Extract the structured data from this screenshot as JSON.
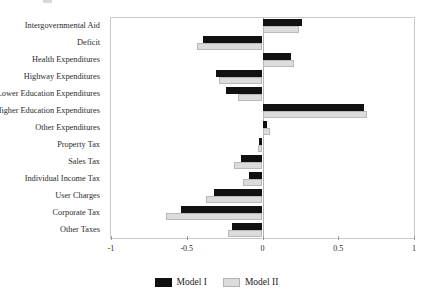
{
  "chart_data": {
    "type": "bar",
    "orientation": "horizontal",
    "title": "",
    "xlabel": "",
    "ylabel": "",
    "xlim": [
      -1,
      1
    ],
    "xticks": [
      -1,
      -0.5,
      0,
      0.5,
      1
    ],
    "xticklabels": [
      "-1",
      "-0.5",
      "0",
      "0.5",
      "1"
    ],
    "grid": false,
    "zero_reference_line": true,
    "legend_position": "bottom-center",
    "categories": [
      "Intergovernmental Aid",
      "Deficit",
      "Health Expenditures",
      "Highway Expenditures",
      "Lower Education Expenditures",
      "Higher Education Expenditures",
      "Other Expenditures",
      "Property Tax",
      "Sales Tax",
      "Individual Income Tax",
      "User Charges",
      "Corporate Tax",
      "Other Taxes"
    ],
    "series": [
      {
        "name": "Model I",
        "color": "#111111",
        "values": [
          0.26,
          -0.39,
          0.19,
          -0.31,
          -0.24,
          0.67,
          0.03,
          -0.02,
          -0.14,
          -0.09,
          -0.32,
          -0.54,
          -0.2
        ]
      },
      {
        "name": "Model II",
        "color": "#dcdcdc",
        "values": [
          0.24,
          -0.43,
          0.21,
          -0.29,
          -0.16,
          0.69,
          0.05,
          -0.03,
          -0.19,
          -0.13,
          -0.37,
          -0.64,
          -0.23
        ]
      }
    ]
  },
  "legend": {
    "items": [
      {
        "label": "Model I",
        "swatch": "dark-swatch"
      },
      {
        "label": "Model II",
        "swatch": "light-swatch"
      }
    ]
  }
}
